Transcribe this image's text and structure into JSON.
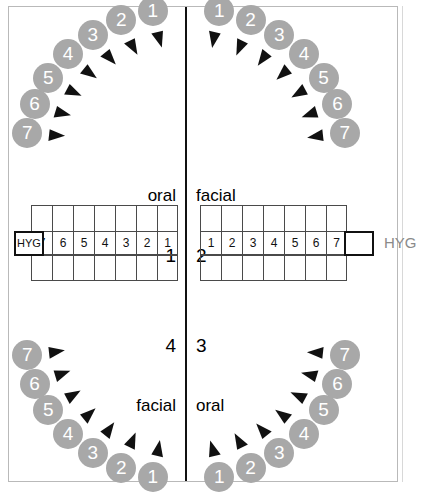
{
  "chart": {
    "colors": {
      "tooth_fill": "#a8a8a8",
      "tooth_text": "#ffffff",
      "pointer": "#111111",
      "grid_line": "#4a4a4a",
      "panel_border": "#b9b9b9",
      "midline": "#111111",
      "caption_grey": "#8a8a8a"
    }
  },
  "quadrants": [
    {
      "id": "q1",
      "number": "1",
      "surface": "oral",
      "align": "right"
    },
    {
      "id": "q2",
      "number": "2",
      "surface": "facial",
      "align": "left"
    },
    {
      "id": "q3",
      "number": "3",
      "surface": "oral",
      "align": "left"
    },
    {
      "id": "q4",
      "number": "4",
      "surface": "facial",
      "align": "right"
    }
  ],
  "grid": {
    "upper_left_numbers": [
      "7",
      "6",
      "5",
      "4",
      "3",
      "2",
      "1"
    ],
    "upper_right_numbers": [
      "1",
      "2",
      "3",
      "4",
      "5",
      "6",
      "7"
    ],
    "hyg_left_label": "HYG",
    "hyg_right_label": "",
    "row_count": 3
  },
  "captions": {
    "hyg_outside": "HYG"
  },
  "arcs": {
    "upper_left": [
      "7",
      "6",
      "5",
      "4",
      "3",
      "2",
      "1"
    ],
    "upper_right": [
      "1",
      "2",
      "3",
      "4",
      "5",
      "6",
      "7"
    ],
    "lower_left": [
      "7",
      "6",
      "5",
      "4",
      "3",
      "2",
      "1"
    ],
    "lower_right": [
      "1",
      "2",
      "3",
      "4",
      "5",
      "6",
      "7"
    ]
  }
}
